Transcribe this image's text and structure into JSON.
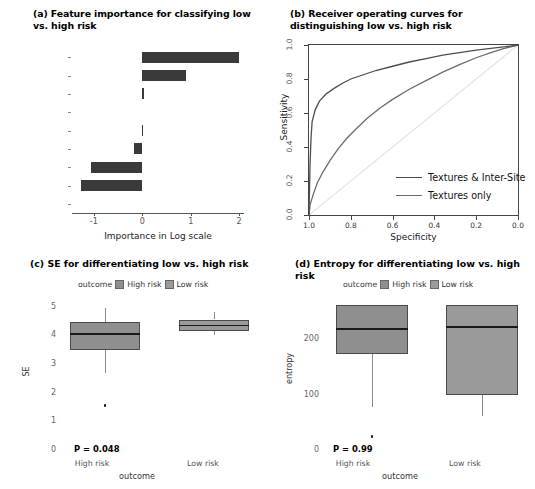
{
  "figure": {
    "panel_a": {
      "title": "(a) Feature importance for classifying low vs. high risk",
      "xlabel": "Importance in Log scale"
    },
    "panel_b": {
      "title": "(b) Receiver operating curves for distinguishing low vs. high risk",
      "xlabel": "Specificity",
      "ylabel": "Sensitivity",
      "legend": [
        "Textures & Inter-Site",
        "Textures only"
      ]
    },
    "panel_c": {
      "title": "(c) SE for differentiating low vs. high risk",
      "legend_title": "outcome",
      "legend": [
        "High risk",
        "Low risk"
      ],
      "ylabel": "SE",
      "xlabel": "outcome",
      "pvalue": "P = 0.048",
      "groups": [
        "High risk",
        "Low risk"
      ]
    },
    "panel_d": {
      "title": "(d) Entropy for differentiating low vs. high risk",
      "legend_title": "outcome",
      "legend": [
        "High risk",
        "Low risk"
      ],
      "ylabel": "entropy",
      "xlabel": "outcome",
      "pvalue": "P = 0.99",
      "groups": [
        "High risk",
        "Low risk"
      ]
    }
  },
  "chart_data": [
    {
      "panel": "a",
      "type": "bar",
      "orientation": "horizontal",
      "title": "(a) Feature importance for classifying low vs. high risk",
      "xlabel": "Importance in Log scale",
      "ylabel": "",
      "categories": [
        "SE",
        "SCP",
        "Entropy",
        "Mean",
        "Correlation",
        "Homogeneity",
        "Energy",
        "Contrast",
        "SCV"
      ],
      "values": [
        2.0,
        0.9,
        0.03,
        0.0,
        0.02,
        -0.17,
        -1.05,
        -1.27,
        0.0
      ],
      "xlim": [
        -1.45,
        2.1
      ],
      "xticks": [
        -1,
        0,
        1,
        2
      ],
      "xticklabels": [
        "-1",
        "0",
        "1",
        "2"
      ],
      "bar_color": "#3a3a3a",
      "grid": false
    },
    {
      "panel": "b",
      "type": "line",
      "title": "(b) Receiver operating curves for distinguishing low vs. high risk",
      "xlabel": "Specificity",
      "ylabel": "Sensitivity",
      "xlim": [
        1.0,
        0.0
      ],
      "ylim": [
        0.0,
        1.0
      ],
      "xticks": [
        1.0,
        0.8,
        0.6,
        0.4,
        0.2,
        0.0
      ],
      "xticklabels": [
        "1.0",
        "0.8",
        "0.6",
        "0.4",
        "0.2",
        "0.0"
      ],
      "yticks": [
        0.0,
        0.2,
        0.4,
        0.6,
        0.8,
        1.0
      ],
      "yticklabels": [
        "0.0",
        "0.2",
        "0.4",
        "0.6",
        "0.8",
        "1.0"
      ],
      "x_axis_reversed": true,
      "grid": false,
      "legend_position": "bottom-right",
      "series": [
        {
          "name": "Textures & Inter-Site",
          "color": "#4d4d4d",
          "points": [
            [
              1.0,
              0.0
            ],
            [
              0.995,
              0.3
            ],
            [
              0.99,
              0.46
            ],
            [
              0.985,
              0.55
            ],
            [
              0.97,
              0.62
            ],
            [
              0.95,
              0.67
            ],
            [
              0.92,
              0.71
            ],
            [
              0.88,
              0.745
            ],
            [
              0.84,
              0.775
            ],
            [
              0.8,
              0.8
            ],
            [
              0.74,
              0.825
            ],
            [
              0.68,
              0.85
            ],
            [
              0.6,
              0.875
            ],
            [
              0.52,
              0.9
            ],
            [
              0.44,
              0.92
            ],
            [
              0.36,
              0.94
            ],
            [
              0.28,
              0.955
            ],
            [
              0.2,
              0.97
            ],
            [
              0.12,
              0.982
            ],
            [
              0.06,
              0.99
            ],
            [
              0.0,
              1.0
            ]
          ]
        },
        {
          "name": "Textures only",
          "color": "#6b6b6b",
          "points": [
            [
              1.0,
              0.0
            ],
            [
              0.995,
              0.06
            ],
            [
              0.98,
              0.12
            ],
            [
              0.96,
              0.19
            ],
            [
              0.93,
              0.26
            ],
            [
              0.9,
              0.32
            ],
            [
              0.86,
              0.39
            ],
            [
              0.82,
              0.45
            ],
            [
              0.78,
              0.5
            ],
            [
              0.72,
              0.57
            ],
            [
              0.66,
              0.63
            ],
            [
              0.6,
              0.68
            ],
            [
              0.52,
              0.74
            ],
            [
              0.44,
              0.79
            ],
            [
              0.36,
              0.84
            ],
            [
              0.28,
              0.885
            ],
            [
              0.2,
              0.925
            ],
            [
              0.13,
              0.955
            ],
            [
              0.07,
              0.978
            ],
            [
              0.0,
              1.0
            ]
          ]
        },
        {
          "name": "reference-diagonal",
          "color": "#e2e2e2",
          "points": [
            [
              1.0,
              0.0
            ],
            [
              0.0,
              1.0
            ]
          ]
        }
      ]
    },
    {
      "panel": "c",
      "type": "box",
      "title": "(c) SE for differentiating low vs. high risk",
      "xlabel": "outcome",
      "ylabel": "SE",
      "ylim": [
        0,
        5.3
      ],
      "yticks": [
        0,
        1,
        2,
        3,
        4,
        5
      ],
      "yticklabels": [
        "0",
        "1",
        "2",
        "3",
        "4",
        "5"
      ],
      "annotation": "P = 0.048",
      "boxes": [
        {
          "group": "High risk",
          "q1": 3.5,
          "median": 4.05,
          "q3": 4.45,
          "whisker_low": 2.7,
          "whisker_high": 4.95,
          "outliers": [
            1.55
          ],
          "fill": "#8f8f8f"
        },
        {
          "group": "Low risk",
          "q1": 4.16,
          "median": 4.34,
          "q3": 4.55,
          "whisker_low": 4.02,
          "whisker_high": 4.8,
          "outliers": [],
          "fill": "#9a9a9a"
        }
      ]
    },
    {
      "panel": "d",
      "type": "box",
      "title": "(d) Entropy for differentiating low vs. high risk",
      "xlabel": "outcome",
      "ylabel": "entropy",
      "ylim": [
        0,
        275
      ],
      "yticks": [
        0,
        100,
        200
      ],
      "yticklabels": [
        "0",
        "100",
        "200"
      ],
      "annotation": "P = 0.99",
      "boxes": [
        {
          "group": "High risk",
          "q1": 174,
          "median": 219,
          "q3": 262,
          "whisker_low": 78,
          "whisker_high": 262,
          "outliers": [
            24
          ],
          "fill": "#8f8f8f"
        },
        {
          "group": "Low risk",
          "q1": 99,
          "median": 222,
          "q3": 262,
          "whisker_low": 62,
          "whisker_high": 262,
          "outliers": [],
          "fill": "#9a9a9a"
        }
      ]
    }
  ]
}
